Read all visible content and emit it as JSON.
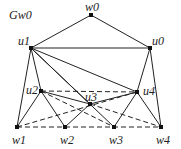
{
  "title": "Gw0",
  "nodes": [
    {
      "id": "w0",
      "label": "w0",
      "x": 91,
      "y": 15,
      "lx": 85,
      "ly": 1
    },
    {
      "id": "u1",
      "label": "u1",
      "x": 31,
      "y": 48,
      "lx": 18,
      "ly": 35
    },
    {
      "id": "u0",
      "label": "u0",
      "x": 150,
      "y": 48,
      "lx": 152,
      "ly": 35
    },
    {
      "id": "u2",
      "label": "u2",
      "x": 41,
      "y": 91,
      "lx": 26,
      "ly": 84
    },
    {
      "id": "u3",
      "label": "u3",
      "x": 90,
      "y": 104,
      "lx": 85,
      "ly": 91
    },
    {
      "id": "u4",
      "label": "u4",
      "x": 137,
      "y": 92,
      "lx": 143,
      "ly": 85
    },
    {
      "id": "w1",
      "label": "w1",
      "x": 17,
      "y": 127,
      "lx": 12,
      "ly": 134
    },
    {
      "id": "w2",
      "label": "w2",
      "x": 65,
      "y": 127,
      "lx": 60,
      "ly": 134
    },
    {
      "id": "w3",
      "label": "w3",
      "x": 114,
      "y": 127,
      "lx": 109,
      "ly": 134
    },
    {
      "id": "w4",
      "label": "w4",
      "x": 161,
      "y": 127,
      "lx": 156,
      "ly": 134
    }
  ],
  "edges_solid": [
    [
      "w0",
      "u1"
    ],
    [
      "w0",
      "u0"
    ],
    [
      "u1",
      "u0"
    ],
    [
      "u1",
      "w1"
    ],
    [
      "u1",
      "u2"
    ],
    [
      "u1",
      "u3"
    ],
    [
      "u1",
      "w3"
    ],
    [
      "u1",
      "u4"
    ],
    [
      "u0",
      "u4"
    ],
    [
      "u0",
      "w4"
    ],
    [
      "u2",
      "w1"
    ],
    [
      "u2",
      "w2"
    ],
    [
      "u2",
      "u3"
    ],
    [
      "u3",
      "u4"
    ],
    [
      "u3",
      "w2"
    ],
    [
      "u4",
      "w3"
    ],
    [
      "u4",
      "w4"
    ]
  ],
  "edges_dashed": [
    [
      "u2",
      "u4"
    ],
    [
      "w1",
      "u4"
    ],
    [
      "u2",
      "w3"
    ],
    [
      "u3",
      "w4"
    ],
    [
      "w1",
      "w4"
    ]
  ],
  "colors": {
    "edge": "#222222",
    "node": "#111111",
    "bg": "#ffffff"
  }
}
